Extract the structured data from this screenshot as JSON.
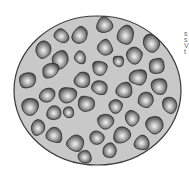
{
  "figure": {
    "container": {
      "shape": "ellipse",
      "cx": 97.5,
      "cy": 90.5,
      "rx": 83.5,
      "ry": 74.5,
      "fill": "#c8c8c8",
      "stroke": "#3a3a3a"
    },
    "particle_style": {
      "highlight": "#f2f2f2",
      "mid": "#8a8a8a",
      "shadow": "#3c3c3c",
      "outline": "#2a2a2a"
    },
    "particles": [
      {
        "x": 105,
        "y": 25,
        "r": 9
      },
      {
        "x": 80,
        "y": 35,
        "r": 9
      },
      {
        "x": 62,
        "y": 36,
        "r": 8
      },
      {
        "x": 126,
        "y": 35,
        "r": 10
      },
      {
        "x": 152,
        "y": 43,
        "r": 9
      },
      {
        "x": 44,
        "y": 50,
        "r": 9
      },
      {
        "x": 105,
        "y": 48,
        "r": 9
      },
      {
        "x": 135,
        "y": 56,
        "r": 9
      },
      {
        "x": 60,
        "y": 60,
        "r": 9
      },
      {
        "x": 80,
        "y": 58,
        "r": 7
      },
      {
        "x": 118,
        "y": 61,
        "r": 6
      },
      {
        "x": 28,
        "y": 80,
        "r": 10
      },
      {
        "x": 50,
        "y": 70,
        "r": 9
      },
      {
        "x": 100,
        "y": 68,
        "r": 9
      },
      {
        "x": 156,
        "y": 66,
        "r": 9
      },
      {
        "x": 83,
        "y": 79,
        "r": 9
      },
      {
        "x": 138,
        "y": 77,
        "r": 9
      },
      {
        "x": 48,
        "y": 95,
        "r": 9
      },
      {
        "x": 68,
        "y": 95,
        "r": 9
      },
      {
        "x": 100,
        "y": 88,
        "r": 9
      },
      {
        "x": 124,
        "y": 90,
        "r": 9
      },
      {
        "x": 160,
        "y": 86,
        "r": 9
      },
      {
        "x": 30,
        "y": 106,
        "r": 9
      },
      {
        "x": 54,
        "y": 113,
        "r": 9
      },
      {
        "x": 86,
        "y": 104,
        "r": 9
      },
      {
        "x": 116,
        "y": 106,
        "r": 8
      },
      {
        "x": 145,
        "y": 100,
        "r": 9
      },
      {
        "x": 170,
        "y": 105,
        "r": 9
      },
      {
        "x": 68,
        "y": 112,
        "r": 6
      },
      {
        "x": 38,
        "y": 127,
        "r": 9
      },
      {
        "x": 105,
        "y": 122,
        "r": 9
      },
      {
        "x": 132,
        "y": 118,
        "r": 9
      },
      {
        "x": 155,
        "y": 125,
        "r": 9
      },
      {
        "x": 55,
        "y": 135,
        "r": 9
      },
      {
        "x": 75,
        "y": 143,
        "r": 9
      },
      {
        "x": 98,
        "y": 138,
        "r": 8
      },
      {
        "x": 122,
        "y": 135,
        "r": 9
      },
      {
        "x": 142,
        "y": 143,
        "r": 9
      },
      {
        "x": 85,
        "y": 157,
        "r": 7
      },
      {
        "x": 110,
        "y": 150,
        "r": 8
      }
    ],
    "cropped_text_lines": [
      "s",
      "s",
      "V",
      "t"
    ]
  }
}
